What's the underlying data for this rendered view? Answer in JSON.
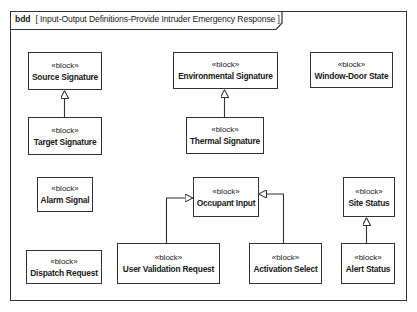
{
  "frame": {
    "kind": "bdd",
    "title": "[ Input-Output Definitions-Provide Intruder Emergency Response ]"
  },
  "blocks": [
    {
      "id": "source_signature",
      "stereotype": "«block»",
      "name": "Source Signature"
    },
    {
      "id": "target_signature",
      "stereotype": "«block»",
      "name": "Target Signature"
    },
    {
      "id": "environmental_signature",
      "stereotype": "«block»",
      "name": "Environmental Signature"
    },
    {
      "id": "thermal_signature",
      "stereotype": "«block»",
      "name": "Thermal Signature"
    },
    {
      "id": "window_door_state",
      "stereotype": "«block»",
      "name": "Window-Door State"
    },
    {
      "id": "alarm_signal",
      "stereotype": "«block»",
      "name": "Alarm Signal"
    },
    {
      "id": "occupant_input",
      "stereotype": "«block»",
      "name": "Occupant Input"
    },
    {
      "id": "site_status",
      "stereotype": "«block»",
      "name": "Site Status"
    },
    {
      "id": "dispatch_request",
      "stereotype": "«block»",
      "name": "Dispatch Request"
    },
    {
      "id": "user_validation_request",
      "stereotype": "«block»",
      "name": "User Validation Request"
    },
    {
      "id": "activation_select",
      "stereotype": "«block»",
      "name": "Activation Select"
    },
    {
      "id": "alert_status",
      "stereotype": "«block»",
      "name": "Alert Status"
    }
  ],
  "generalizations": [
    {
      "from": "Target Signature",
      "to": "Source Signature"
    },
    {
      "from": "Thermal Signature",
      "to": "Environmental Signature"
    },
    {
      "from": "User Validation Request",
      "to": "Occupant Input"
    },
    {
      "from": "Activation Select",
      "to": "Occupant Input"
    },
    {
      "from": "Alert Status",
      "to": "Site Status"
    }
  ]
}
